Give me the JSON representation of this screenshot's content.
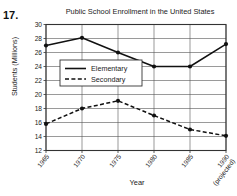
{
  "problem_number": "17.",
  "axis": {
    "y_title": "Students (Millions)",
    "x_title": "Year"
  },
  "chart_data": {
    "type": "line",
    "title": "Public School Enrollment in the United States",
    "xlabel": "Year",
    "ylabel": "Students (Millions)",
    "categories": [
      "1965",
      "1970",
      "1975",
      "1980",
      "1985",
      "1990"
    ],
    "x_tick_labels": [
      "1965",
      "1970",
      "1975",
      "1980",
      "1985",
      "1990"
    ],
    "x_tick_sublabels": [
      "",
      "",
      "",
      "",
      "",
      "(projected)"
    ],
    "y_ticks": [
      12,
      14,
      16,
      18,
      20,
      22,
      24,
      26,
      28,
      30
    ],
    "ylim": [
      12,
      30
    ],
    "grid": true,
    "legend_position": "upper-left-inside",
    "series": [
      {
        "name": "Elementary",
        "style": "solid",
        "color": "#111111",
        "values": [
          27.0,
          28.1,
          26.0,
          24.0,
          24.0,
          27.2
        ]
      },
      {
        "name": "Secondary",
        "style": "dashed",
        "color": "#111111",
        "values": [
          15.8,
          18.0,
          19.1,
          17.0,
          15.0,
          14.1
        ]
      }
    ]
  }
}
